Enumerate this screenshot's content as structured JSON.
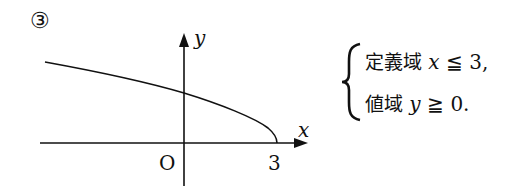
{
  "problem_number": "③",
  "graph": {
    "x_axis_label": "x",
    "y_axis_label": "y",
    "origin_label": "O",
    "x_tick_label": "3"
  },
  "conditions": {
    "domain_label": "定義域",
    "domain_expr_var": "x",
    "domain_expr_rel": "≦",
    "domain_expr_val": "3,",
    "range_label": "値域",
    "range_expr_var": "y",
    "range_expr_rel": "≧",
    "range_expr_val": "0."
  }
}
